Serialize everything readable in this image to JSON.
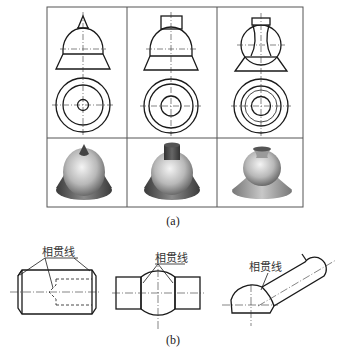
{
  "figure_a": {
    "caption": "(a)",
    "grid": {
      "rows": 2,
      "cols": 3
    },
    "columns": [
      {
        "name": "cone-top",
        "top_feature": "cone",
        "render": "cone-on-sphere-on-frustum"
      },
      {
        "name": "cylinder-top",
        "top_feature": "cylinder",
        "render": "cylinder-on-sphere-on-frustum"
      },
      {
        "name": "hollow-neck",
        "top_feature": "hyperbolic-neck",
        "render": "neck-on-sphere-on-frustum"
      }
    ]
  },
  "figure_b": {
    "caption": "(b)",
    "label_text": "相贯线",
    "items": [
      {
        "name": "chamfered-cylinder",
        "label": "相贯线"
      },
      {
        "name": "sphere-with-cylinders",
        "label": "相贯线"
      },
      {
        "name": "sphere-with-inclined-cylinder",
        "label": "相贯线"
      }
    ]
  },
  "colors": {
    "line": "#1a1a1a",
    "grid": "#555555",
    "center_line": "#333333"
  }
}
